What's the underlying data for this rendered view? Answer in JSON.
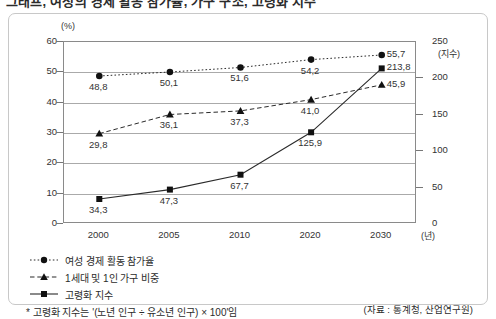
{
  "title": "그래프, 여성의 경제 활동 참가율, 가구 구조, 고령화 지수",
  "chart_data": {
    "type": "line",
    "title": "",
    "xlabel": "(년)",
    "ylabel": "(%)",
    "y2label": "(지수)",
    "grid": true,
    "legend_position": "bottom-left",
    "categories": [
      "2000",
      "2005",
      "2010",
      "2020",
      "2030"
    ],
    "ylim": [
      0,
      60
    ],
    "yticks": [
      "0",
      "10",
      "20",
      "30",
      "40",
      "50",
      "60"
    ],
    "y2lim": [
      0,
      250
    ],
    "y2ticks": [
      "0",
      "50",
      "100",
      "150",
      "200",
      "250"
    ],
    "series": [
      {
        "name": "여성 경제 활동 참가율",
        "axis": "left",
        "marker": "circle",
        "line_style": "dotted",
        "values": [
          48.8,
          50.1,
          51.6,
          54.2,
          55.7
        ],
        "labels": [
          "48,8",
          "50,1",
          "51,6",
          "54,2",
          "55,7"
        ]
      },
      {
        "name": "1세대 및 1인 가구 비중",
        "axis": "left",
        "marker": "triangle",
        "line_style": "dashed",
        "values": [
          29.8,
          36.1,
          37.3,
          41.0,
          45.9
        ],
        "labels": [
          "29,8",
          "36,1",
          "37,3",
          "41,0",
          "45,9"
        ]
      },
      {
        "name": "고령화 지수",
        "axis": "right",
        "marker": "square",
        "line_style": "solid",
        "values": [
          34.3,
          47.3,
          67.7,
          125.9,
          213.8
        ],
        "labels": [
          "34,3",
          "47,3",
          "67,7",
          "125,9",
          "213,8"
        ]
      }
    ],
    "footnote": "* 고령화 지수는 '(노년 인구 ÷ 유소년 인구) × 100'임",
    "source": "(자료 : 통계청, 산업연구원)"
  }
}
